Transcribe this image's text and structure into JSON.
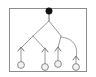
{
  "figure": {
    "type": "rooted-tree-graph",
    "frame": {
      "x": 9,
      "y": 8,
      "width": 78,
      "height": 64,
      "stroke_color": "#8e8e8e",
      "fill_color": "#ffffff"
    },
    "colors": {
      "background": "#ffffff",
      "frame_stroke": "#8e8e8e",
      "edge_stroke": "#9a9a9a",
      "edge_stroke_dark": "#6f6f6f",
      "root_fill": "#111111",
      "leaf_fill": "#f2f2f2",
      "leaf_stroke": "#8a8a8a"
    },
    "nodes": [
      {
        "id": "root",
        "label": "",
        "kind": "filled-circle",
        "cx": 49,
        "cy": 11,
        "r": 3.2
      },
      {
        "id": "leaf1",
        "label": "",
        "kind": "open-circle",
        "cx": 21,
        "cy": 65,
        "r": 3.4
      },
      {
        "id": "leaf2",
        "label": "",
        "kind": "open-circle",
        "cx": 45,
        "cy": 67,
        "r": 3.4
      },
      {
        "id": "leaf3",
        "label": "",
        "kind": "open-circle",
        "cx": 58,
        "cy": 64,
        "r": 3.4
      },
      {
        "id": "leaf4",
        "label": "",
        "kind": "open-circle",
        "cx": 76,
        "cy": 67,
        "r": 3.4
      }
    ],
    "junctions": [
      {
        "id": "j-root-split",
        "x": 49,
        "y": 20
      },
      {
        "id": "j-left",
        "x": 33,
        "y": 36
      },
      {
        "id": "j-right",
        "x": 61,
        "y": 36
      }
    ],
    "edges": [
      {
        "id": "e-root-stem",
        "kind": "line",
        "path": "M49,14 L49,21"
      },
      {
        "id": "e-root-left",
        "kind": "line",
        "path": "M49,21 L33,36"
      },
      {
        "id": "e-root-right",
        "kind": "line",
        "path": "M49,21 L61,36"
      },
      {
        "id": "e-left-outer",
        "kind": "line",
        "path": "M33,36 L20,49"
      },
      {
        "id": "e-left-inner",
        "kind": "line",
        "path": "M33,36 L45,49"
      },
      {
        "id": "e-right-inner",
        "kind": "line",
        "path": "M61,36 L58,48"
      },
      {
        "id": "e-right-curve",
        "kind": "curve",
        "path": "M61,37 C72,38 79,45 76,58"
      },
      {
        "id": "e-leaf1-stem",
        "kind": "line",
        "path": "M21,48 L21,62"
      },
      {
        "id": "e-leaf2-stem",
        "kind": "line",
        "path": "M45,48 L45,64"
      },
      {
        "id": "e-leaf3-stem",
        "kind": "line",
        "path": "M58,47 L58,61"
      },
      {
        "id": "e-leaf4-stem",
        "kind": "line",
        "path": "M76,57 L76,64"
      }
    ],
    "arrowheads": [
      {
        "id": "a-leaf1",
        "path": "M18,51 L21,47 L24,51"
      },
      {
        "id": "a-leaf2",
        "path": "M42,52 L45,48 L48,52"
      },
      {
        "id": "a-leaf3",
        "path": "M55,51 L58,47 L61,51"
      },
      {
        "id": "a-leaf4",
        "path": "M73,60 L76,56 L79,60"
      }
    ]
  }
}
